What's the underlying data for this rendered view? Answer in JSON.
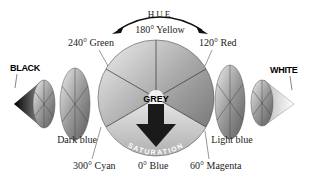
{
  "diagram": {
    "hue_label": "HUE",
    "saturation_label": "SATURATION",
    "center_label": "GREY",
    "ends": {
      "left": "BLACK",
      "right": "WHITE"
    },
    "hue_angles": [
      {
        "label": "180° Yellow",
        "position": "top"
      },
      {
        "label": "240° Green",
        "position": "upper-left"
      },
      {
        "label": "120° Red",
        "position": "upper-right"
      },
      {
        "label": "300° Cyan",
        "position": "lower-left"
      },
      {
        "label": "0° Blue",
        "position": "bottom"
      },
      {
        "label": "60° Magenta",
        "position": "lower-right"
      }
    ],
    "slices": {
      "left": "Dark blue",
      "right": "Light blue"
    }
  }
}
